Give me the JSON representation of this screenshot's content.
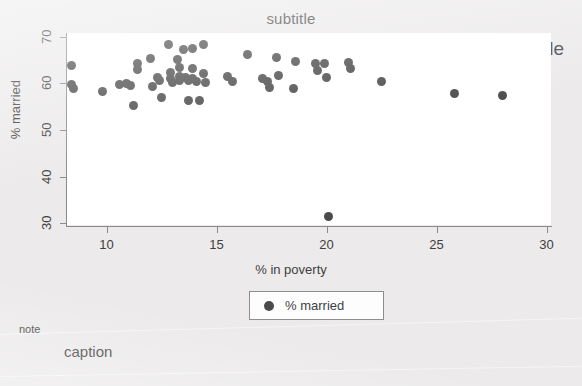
{
  "titles": {
    "title": "title",
    "subtitle": "subtitle",
    "note": "note",
    "caption": "caption"
  },
  "legend": {
    "entries": [
      {
        "label": "% married",
        "marker": "filled-circle",
        "color": "#4a4a4a"
      }
    ]
  },
  "colors": {
    "background": "#eceaea",
    "plot_background": "#ffffff",
    "marker": "#4a4a4a",
    "axis": "#8b8b8b",
    "text": "#3f3f3f"
  },
  "chart_data": {
    "type": "scatter",
    "title": "title",
    "subtitle": "subtitle",
    "note": "note",
    "caption": "caption",
    "xlabel": "% in poverty",
    "ylabel": "% married",
    "xlim": [
      8.2,
      30.2
    ],
    "ylim": [
      29.4,
      70.8
    ],
    "xticks": [
      10,
      15,
      20,
      25,
      30
    ],
    "yticks": [
      30,
      40,
      50,
      60,
      70
    ],
    "xtick_labels": [
      "10",
      "15",
      "20",
      "25",
      "30"
    ],
    "ytick_labels": [
      "30",
      "40",
      "50",
      "60",
      "70"
    ],
    "grid": false,
    "legend_position": "below-axis-center",
    "series": [
      {
        "name": "% married",
        "marker": "circle",
        "color": "#4a4a4a",
        "points": [
          [
            8.4,
            63.9
          ],
          [
            8.4,
            59.8
          ],
          [
            8.5,
            59.0
          ],
          [
            9.8,
            58.2
          ],
          [
            10.6,
            59.8
          ],
          [
            10.9,
            59.9
          ],
          [
            11.1,
            59.5
          ],
          [
            11.2,
            55.2
          ],
          [
            11.4,
            64.3
          ],
          [
            11.4,
            62.9
          ],
          [
            12.0,
            65.3
          ],
          [
            12.1,
            59.4
          ],
          [
            12.3,
            61.3
          ],
          [
            12.4,
            60.7
          ],
          [
            12.5,
            56.9
          ],
          [
            12.8,
            68.3
          ],
          [
            12.9,
            62.4
          ],
          [
            12.9,
            61.0
          ],
          [
            13.0,
            60.2
          ],
          [
            13.2,
            65.2
          ],
          [
            13.3,
            63.3
          ],
          [
            13.3,
            61.4
          ],
          [
            13.3,
            60.6
          ],
          [
            13.5,
            67.2
          ],
          [
            13.6,
            61.2
          ],
          [
            13.7,
            60.6
          ],
          [
            13.7,
            56.4
          ],
          [
            13.9,
            67.4
          ],
          [
            13.9,
            63.2
          ],
          [
            13.9,
            61.0
          ],
          [
            14.1,
            60.5
          ],
          [
            14.2,
            56.3
          ],
          [
            14.4,
            68.3
          ],
          [
            14.4,
            62.1
          ],
          [
            14.5,
            60.2
          ],
          [
            15.5,
            61.4
          ],
          [
            15.7,
            60.3
          ],
          [
            16.4,
            66.2
          ],
          [
            17.1,
            61.0
          ],
          [
            17.3,
            60.3
          ],
          [
            17.4,
            59.2
          ],
          [
            17.7,
            65.5
          ],
          [
            17.8,
            61.7
          ],
          [
            18.5,
            59.0
          ],
          [
            18.6,
            64.7
          ],
          [
            19.5,
            64.3
          ],
          [
            19.6,
            62.8
          ],
          [
            19.9,
            64.2
          ],
          [
            20.0,
            61.3
          ],
          [
            20.1,
            31.4
          ],
          [
            21.0,
            64.5
          ],
          [
            21.1,
            63.2
          ],
          [
            22.5,
            60.3
          ],
          [
            25.8,
            57.9
          ],
          [
            28.0,
            57.5
          ]
        ]
      }
    ]
  }
}
